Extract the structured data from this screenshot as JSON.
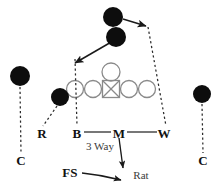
{
  "diagram": {
    "sport": "american-football",
    "colors": {
      "defender_fill": "#0d0d0d",
      "offense_stroke": "#808080",
      "line_stroke": "#4d4d4d",
      "dash_stroke": "#2b2b2b",
      "text": "#111111",
      "text_muted": "#3b3b3b",
      "background": "#ffffff"
    },
    "offense": {
      "label": "Offensive formation",
      "center": {
        "name": "center-box",
        "shape": "square-with-x",
        "x": 111,
        "y": 89,
        "size": 17
      },
      "quarterback": {
        "name": "quarterback-circle",
        "shape": "circle",
        "x": 111,
        "y": 72,
        "r": 9
      },
      "linemen": [
        {
          "name": "lineman-left-outside",
          "x": 75,
          "y": 89,
          "r": 8.5
        },
        {
          "name": "lineman-left-inside",
          "x": 93,
          "y": 89,
          "r": 8.5
        },
        {
          "name": "lineman-right-inside",
          "x": 129,
          "y": 89,
          "r": 8.5
        },
        {
          "name": "lineman-right-outside",
          "x": 147,
          "y": 89,
          "r": 8.5
        }
      ]
    },
    "defenders": [
      {
        "name": "defender-safety-top",
        "x": 113,
        "y": 17,
        "r": 10
      },
      {
        "name": "defender-safety-second",
        "x": 116,
        "y": 37,
        "r": 10
      },
      {
        "name": "defender-cornerback-left",
        "x": 20,
        "y": 76,
        "r": 10
      },
      {
        "name": "defender-cornerback-right",
        "x": 202,
        "y": 94,
        "r": 9
      },
      {
        "name": "defender-rover",
        "x": 60,
        "y": 97,
        "r": 9
      }
    ],
    "labels": [
      {
        "id": "rover",
        "text": "R",
        "x": 42,
        "y": 133,
        "style": "bold"
      },
      {
        "id": "buck",
        "text": "B",
        "x": 77,
        "y": 133,
        "style": "bold"
      },
      {
        "id": "mike",
        "text": "M",
        "x": 119,
        "y": 133,
        "style": "bold"
      },
      {
        "id": "will",
        "text": "W",
        "x": 164,
        "y": 133,
        "style": "bold"
      },
      {
        "id": "corner-left",
        "text": "C",
        "x": 21,
        "y": 160,
        "style": "bold"
      },
      {
        "id": "corner-right",
        "text": "C",
        "x": 203,
        "y": 160,
        "style": "bold"
      },
      {
        "id": "free-safety",
        "text": "FS",
        "x": 70,
        "y": 172,
        "style": "bold"
      },
      {
        "id": "three-way",
        "text": "3 Way",
        "x": 100,
        "y": 146,
        "style": "plain"
      },
      {
        "id": "rat",
        "text": "Rat",
        "x": 141,
        "y": 175,
        "style": "plain"
      }
    ],
    "connector_label": "B — M — W linebacker level",
    "notes": {
      "coverage_call": "3 Way",
      "rat_assignment": "Rat"
    }
  }
}
